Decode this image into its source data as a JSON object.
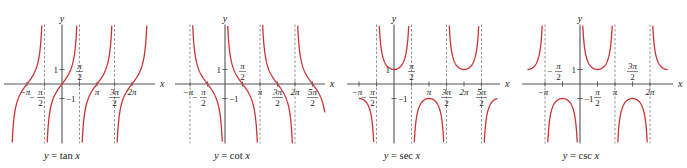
{
  "figure": {
    "curve_color": "#cc3333",
    "axis_color": "#555555",
    "asymptote_color": "#777777"
  },
  "chart_data": [
    {
      "type": "line",
      "function": "tan",
      "title": "y = tan x",
      "caption_y": "y",
      "caption_eq": "= tan",
      "caption_x": "x",
      "xlabel": "x",
      "ylabel": "y",
      "x_range_pi": [
        -1.65,
        2.65
      ],
      "y_range": [
        -4.1,
        4.1
      ],
      "curve_x_range_pi": [
        -1.5,
        2.5
      ],
      "asymptotes_pi": [
        -0.5,
        0.5,
        1.5
      ],
      "x_tick_labels": [
        "-π",
        "-π/2",
        "π/2",
        "π",
        "3π/2",
        "2π"
      ],
      "y_tick_labels": [
        "1",
        "-1"
      ],
      "grid": false,
      "origin_px": [
        62,
        84
      ],
      "pi_px": 35,
      "unit_px": 14.5,
      "axis_px": [
        4,
        155
      ]
    },
    {
      "type": "line",
      "function": "cot",
      "title": "y = cot x",
      "caption_y": "y",
      "caption_eq": "= cot",
      "caption_x": "x",
      "xlabel": "x",
      "ylabel": "y",
      "x_range_pi": [
        -1.2,
        2.95
      ],
      "y_range": [
        -4.1,
        4.1
      ],
      "curve_x_range_pi": [
        -1,
        2.85
      ],
      "asymptotes_pi": [
        -1,
        1,
        2
      ],
      "x_tick_labels": [
        "-π",
        "-π/2",
        "π/2",
        "π",
        "3π/2",
        "2π",
        "5π/2"
      ],
      "y_tick_labels": [
        "1",
        "-1"
      ],
      "grid": false,
      "origin_px": [
        225,
        84
      ],
      "pi_px": 35,
      "unit_px": 14.5,
      "axis_px": [
        175,
        325
      ]
    },
    {
      "type": "line",
      "function": "sec",
      "title": "y = sec x",
      "caption_y": "y",
      "caption_eq": "= sec",
      "caption_x": "x",
      "xlabel": "x",
      "ylabel": "y",
      "x_range_pi": [
        -1.35,
        3.0
      ],
      "y_range": [
        -4.1,
        4.1
      ],
      "curve_x_range_pi": [
        -1.0,
        2.95
      ],
      "asymptotes_pi": [
        -0.5,
        0.5,
        1.5,
        2.5
      ],
      "x_tick_labels": [
        "-π",
        "-π/2",
        "π/2",
        "π",
        "3π/2",
        "2π",
        "5π/2"
      ],
      "y_tick_labels": [
        "1",
        "-1"
      ],
      "grid": false,
      "origin_px": [
        394,
        84
      ],
      "pi_px": 35,
      "unit_px": 14.5,
      "axis_px": [
        347,
        500
      ]
    },
    {
      "type": "line",
      "function": "csc",
      "title": "y = csc x",
      "caption_y": "y",
      "caption_eq": "= csc",
      "caption_x": "x",
      "xlabel": "x",
      "ylabel": "y",
      "x_range_pi": [
        -1.65,
        2.65
      ],
      "y_range": [
        -4.1,
        4.1
      ],
      "curve_x_range_pi": [
        -1.5,
        2.5
      ],
      "asymptotes_pi": [
        -1,
        0,
        1,
        2
      ],
      "x_tick_labels": [
        "-π",
        "-π/2",
        "π/2",
        "π",
        "3π/2",
        "2π"
      ],
      "y_tick_labels": [
        "1",
        "-1"
      ],
      "grid": false,
      "origin_px": [
        580,
        84
      ],
      "pi_px": 35,
      "unit_px": 14.5,
      "axis_px": [
        522,
        673
      ]
    }
  ]
}
